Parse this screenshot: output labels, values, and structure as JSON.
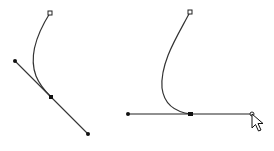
{
  "colors": {
    "background": "#ffffff",
    "stroke": "#222222",
    "curve": "#333333"
  },
  "diagrams": [
    {
      "name": "before",
      "end_anchor": {
        "x": 50,
        "y": 13
      },
      "anchor": {
        "x": 51,
        "y": 97
      },
      "handle_a": {
        "x": 15,
        "y": 61
      },
      "handle_b": {
        "x": 88,
        "y": 134
      }
    },
    {
      "name": "after",
      "end_anchor": {
        "x": 190,
        "y": 12
      },
      "anchor": {
        "x": 191,
        "y": 114
      },
      "handle_a": {
        "x": 128,
        "y": 114
      },
      "handle_b": {
        "x": 252,
        "y": 114
      },
      "cursor": {
        "x": 252,
        "y": 114
      }
    }
  ]
}
